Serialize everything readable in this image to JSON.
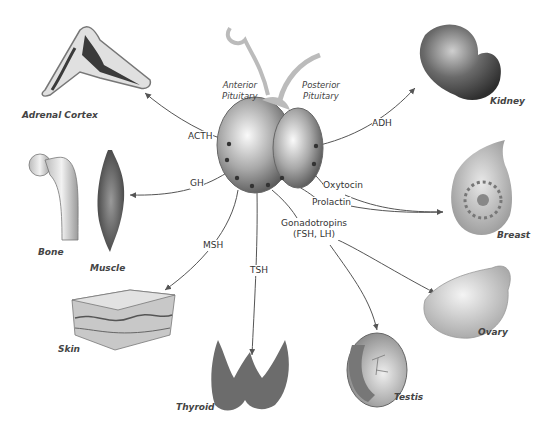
{
  "diagram": {
    "center": {
      "name": "Pituitary Gland",
      "anterior_label_line1": "Anterior",
      "anterior_label_line2": "Pituitary",
      "posterior_label_line1": "Posterior",
      "posterior_label_line2": "Pituitary"
    },
    "hormones": {
      "acth": "ACTH",
      "gh": "GH",
      "msh": "MSH",
      "tsh": "TSH",
      "gonadotropins_line1": "Gonadotropins",
      "gonadotropins_line2": "(FSH, LH)",
      "adh": "ADH",
      "oxytocin": "Oxytocin",
      "prolactin": "Prolactin"
    },
    "targets": {
      "adrenal": "Adrenal Cortex",
      "bone": "Bone",
      "muscle": "Muscle",
      "skin": "Skin",
      "thyroid": "Thyroid",
      "testis": "Testis",
      "ovary": "Ovary",
      "breast": "Breast",
      "kidney": "Kidney"
    },
    "colors": {
      "background": "#ffffff",
      "line": "#555555",
      "organ_dark": "#4a4a4a",
      "organ_light": "#d8d8d8"
    }
  }
}
